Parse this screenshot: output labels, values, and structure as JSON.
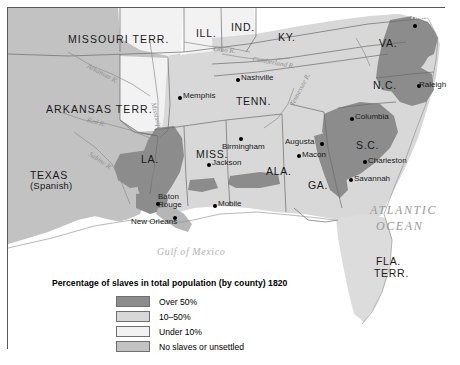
{
  "map": {
    "title": "Percentage of slaves in total population (by county) 1820",
    "territories": [
      {
        "name": "MISSOURI TERR.",
        "x": 60,
        "y": 26
      },
      {
        "name": "ARKANSAS TERR.",
        "x": 38,
        "y": 96
      },
      {
        "name": "ILL.",
        "x": 188,
        "y": 20
      },
      {
        "name": "IND.",
        "x": 223,
        "y": 14
      },
      {
        "name": "KY.",
        "x": 270,
        "y": 24
      },
      {
        "name": "VA.",
        "x": 371,
        "y": 30
      },
      {
        "name": "TENN.",
        "x": 228,
        "y": 88
      },
      {
        "name": "N.C.",
        "x": 365,
        "y": 72
      },
      {
        "name": "MISS.",
        "x": 188,
        "y": 141
      },
      {
        "name": "ALA.",
        "x": 258,
        "y": 158
      },
      {
        "name": "LA.",
        "x": 133,
        "y": 146
      },
      {
        "name": "S.C.",
        "x": 348,
        "y": 132
      },
      {
        "name": "GA.",
        "x": 300,
        "y": 172
      },
      {
        "name": "FLA.",
        "x": 368,
        "y": 248
      },
      {
        "name": "TERR.",
        "x": 366,
        "y": 260
      }
    ],
    "texas_label": {
      "line1": "TEXAS",
      "line2": "(Spanish)",
      "x": 22,
      "y": 162
    },
    "cities": [
      {
        "name": "Richmond",
        "x": 405,
        "y": 16,
        "dx": -2,
        "dy": 11,
        "label_above": true,
        "white": true
      },
      {
        "name": "Raleigh",
        "x": 409,
        "y": 76,
        "dx": 2,
        "dy": -3,
        "label_above": false,
        "white": false
      },
      {
        "name": "Nashville",
        "x": 228,
        "y": 70,
        "dx": 5,
        "dy": -4,
        "label_above": false,
        "white": false
      },
      {
        "name": "Memphis",
        "x": 170,
        "y": 88,
        "dx": 5,
        "dy": -4,
        "label_above": false,
        "white": false
      },
      {
        "name": "Birmingham",
        "x": 231,
        "y": 129,
        "dx": -17,
        "dy": 6,
        "label_above": false,
        "white": false
      },
      {
        "name": "Jackson",
        "x": 199,
        "y": 155,
        "dx": 5,
        "dy": -4,
        "label_above": false,
        "white": false
      },
      {
        "name": "Columbia",
        "x": 342,
        "y": 109,
        "dx": 5,
        "dy": -4,
        "label_above": false,
        "white": false
      },
      {
        "name": "Augusta",
        "x": 312,
        "y": 134,
        "dx": -35,
        "dy": -4,
        "label_above": false,
        "white": false
      },
      {
        "name": "Macon",
        "x": 289,
        "y": 146,
        "dx": 5,
        "dy": -3,
        "label_above": false,
        "white": false
      },
      {
        "name": "Charleston",
        "x": 355,
        "y": 152,
        "dx": 5,
        "dy": -3,
        "label_above": false,
        "white": false
      },
      {
        "name": "Savannah",
        "x": 341,
        "y": 170,
        "dx": 5,
        "dy": -3,
        "label_above": false,
        "white": false
      },
      {
        "name": "Mobile",
        "x": 205,
        "y": 196,
        "dx": 5,
        "dy": -4,
        "label_above": false,
        "white": false
      },
      {
        "name": "New Orleans",
        "x": 165,
        "y": 208,
        "dx": -42,
        "dy": 2,
        "label_above": false,
        "white": false
      }
    ],
    "baton_rouge": {
      "line1": "Baton",
      "line2": "Rouge",
      "x": 150,
      "y": 185,
      "dot_x": 148,
      "dot_y": 194
    },
    "water_labels": [
      {
        "name": "ATLANTIC",
        "x": 362,
        "y": 196
      },
      {
        "name": "OCEAN",
        "x": 368,
        "y": 212
      }
    ],
    "gulf_label": {
      "name": "Gulf of Mexico",
      "x": 149,
      "y": 239
    },
    "rivers": [
      {
        "name": "Arkansas R.",
        "x": 81,
        "y": 55,
        "rot": 28
      },
      {
        "name": "Red R.",
        "x": 80,
        "y": 109,
        "rot": 14
      },
      {
        "name": "Mississippi R.",
        "x": 148,
        "y": 94,
        "rot": 76
      },
      {
        "name": "Ohio R.",
        "x": 206,
        "y": 38,
        "rot": 6
      },
      {
        "name": "Cumberland R.",
        "x": 245,
        "y": 48,
        "rot": 10
      },
      {
        "name": "Sabine R.",
        "x": 83,
        "y": 143,
        "rot": 34
      },
      {
        "name": "Tennessee R.",
        "x": 281,
        "y": 96,
        "rot": -62
      }
    ],
    "legend": {
      "items": [
        {
          "label": "Over 50%",
          "color": "#8c8c8c"
        },
        {
          "label": "10–50%",
          "color": "#d8d8d8"
        },
        {
          "label": "Under 10%",
          "color": "#f2f2f2"
        },
        {
          "label": "No slaves or unsettled",
          "color": "#c2c2c2"
        }
      ]
    },
    "colors": {
      "over50": "#8c8c8c",
      "pct10to50": "#d8d8d8",
      "under10": "#f2f2f2",
      "unsettled": "#c2c2c2",
      "ocean": "#ffffff",
      "border": "#5a5a5a",
      "stateline": "#6b6b6b"
    }
  },
  "chart_data": {
    "type": "map",
    "title": "Percentage of slaves in total population (by county) 1820",
    "categories": [
      "Over 50%",
      "10–50%",
      "Under 10%",
      "No slaves or unsettled"
    ],
    "values": [
      null,
      null,
      null,
      null
    ],
    "legend_position": "bottom-left",
    "regions_over_50": [
      "Virginia Tidewater / Richmond area",
      "Eastern North Carolina",
      "South Carolina Lowcountry (Charleston, Columbia)",
      "Savannah River / Augusta corridor",
      "Lower Mississippi Valley (Natchez, Baton Rouge, New Orleans)",
      "Alabama Black Belt"
    ],
    "xlabel": "",
    "ylabel": ""
  }
}
